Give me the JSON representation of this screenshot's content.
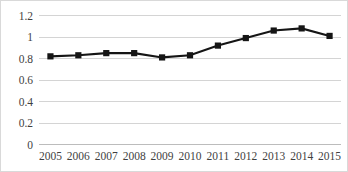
{
  "chart_data": {
    "type": "line",
    "title": "",
    "subtitle": "",
    "xlabel": "",
    "ylabel": "",
    "categories": [
      "2005",
      "2006",
      "2007",
      "2008",
      "2009",
      "2010",
      "2011",
      "2012",
      "2013",
      "2014",
      "2015"
    ],
    "values": [
      0.82,
      0.83,
      0.85,
      0.85,
      0.81,
      0.83,
      0.92,
      0.99,
      1.06,
      1.08,
      1.01
    ],
    "series": [
      {
        "name": "series-1",
        "values": [
          0.82,
          0.83,
          0.85,
          0.85,
          0.81,
          0.83,
          0.92,
          0.99,
          1.06,
          1.08,
          1.01
        ],
        "color": "#151515",
        "marker": "square"
      }
    ],
    "ylim": [
      0,
      1.2
    ],
    "ytick_labels": [
      "1.2",
      "1",
      "0.8",
      "0.6",
      "0.4",
      "0.2",
      "0"
    ],
    "ytick_values": [
      1.2,
      1.0,
      0.8,
      0.6,
      0.4,
      0.2,
      0
    ],
    "xtick_labels": [
      "2005",
      "2006",
      "2007",
      "2008",
      "2009",
      "2010",
      "2011",
      "2012",
      "2013",
      "2014",
      "2015"
    ],
    "grid": {
      "horizontal": true,
      "vertical": false,
      "color": "#c9c9c9"
    },
    "legend": {
      "visible": false,
      "position": "none",
      "entries": []
    },
    "annotations": [],
    "colors": {
      "line": "#151515",
      "marker": "#151515",
      "grid": "#c9c9c9",
      "axis": "#b5b5b5",
      "text": "#3f3f3f",
      "background": "#ffffff",
      "border": "#d9d9d9"
    }
  }
}
